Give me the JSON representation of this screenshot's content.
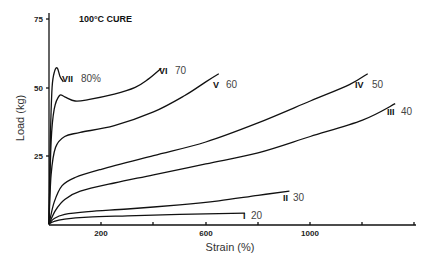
{
  "chart_data": {
    "type": "line",
    "title": "100°C CURE",
    "xlabel": "Strain (%)",
    "ylabel": "Load (kg)",
    "xlim": [
      0,
      1450
    ],
    "ylim": [
      0,
      75
    ],
    "x_ticks": [
      200,
      400,
      600,
      800,
      1000,
      1200,
      1400
    ],
    "x_tick_labels": [
      "200",
      "",
      "600",
      "",
      "1000",
      "",
      ""
    ],
    "y_ticks": [
      25,
      50,
      75
    ],
    "y_tick_labels": [
      "25",
      "50",
      "75"
    ],
    "grid": false,
    "legend": "inline labels at curve ends",
    "series": [
      {
        "name": "VII",
        "label_pct": "80%",
        "points": [
          [
            0,
            0
          ],
          [
            5,
            30
          ],
          [
            12,
            50
          ],
          [
            22,
            56
          ],
          [
            32,
            57
          ],
          [
            42,
            54
          ],
          [
            55,
            52
          ]
        ]
      },
      {
        "name": "VI",
        "label_pct": "70",
        "points": [
          [
            0,
            0
          ],
          [
            8,
            30
          ],
          [
            20,
            42
          ],
          [
            40,
            47
          ],
          [
            60,
            46.5
          ],
          [
            100,
            45
          ],
          [
            150,
            45.5
          ],
          [
            250,
            47.5
          ],
          [
            330,
            50
          ],
          [
            380,
            53
          ],
          [
            430,
            57
          ]
        ]
      },
      {
        "name": "V",
        "label_pct": "60",
        "points": [
          [
            0,
            0
          ],
          [
            8,
            18
          ],
          [
            25,
            28
          ],
          [
            60,
            32
          ],
          [
            120,
            33.5
          ],
          [
            250,
            36
          ],
          [
            400,
            41
          ],
          [
            520,
            47
          ],
          [
            600,
            52
          ],
          [
            650,
            55
          ]
        ]
      },
      {
        "name": "IV",
        "label_pct": "50",
        "points": [
          [
            0,
            0
          ],
          [
            20,
            8
          ],
          [
            50,
            14
          ],
          [
            100,
            17
          ],
          [
            200,
            20
          ],
          [
            400,
            25
          ],
          [
            600,
            30
          ],
          [
            800,
            37
          ],
          [
            1000,
            45
          ],
          [
            1150,
            51
          ],
          [
            1220,
            55
          ]
        ]
      },
      {
        "name": "III",
        "label_pct": "40",
        "points": [
          [
            0,
            0
          ],
          [
            25,
            5
          ],
          [
            60,
            9
          ],
          [
            120,
            12
          ],
          [
            250,
            15
          ],
          [
            400,
            18
          ],
          [
            600,
            22
          ],
          [
            800,
            26
          ],
          [
            1000,
            32
          ],
          [
            1200,
            38
          ],
          [
            1325,
            44
          ]
        ]
      },
      {
        "name": "II",
        "label_pct": "30",
        "points": [
          [
            0,
            0
          ],
          [
            20,
            2
          ],
          [
            60,
            3.5
          ],
          [
            150,
            4.5
          ],
          [
            300,
            5.5
          ],
          [
            500,
            7
          ],
          [
            650,
            8.5
          ],
          [
            800,
            10.5
          ],
          [
            920,
            12
          ]
        ]
      },
      {
        "name": "I",
        "label_pct": "20",
        "points": [
          [
            0,
            0
          ],
          [
            20,
            1
          ],
          [
            60,
            1.8
          ],
          [
            150,
            2.5
          ],
          [
            300,
            3
          ],
          [
            500,
            3.5
          ],
          [
            650,
            3.8
          ],
          [
            750,
            4
          ]
        ]
      }
    ]
  },
  "labels": {
    "title": "100°C CURE",
    "xlabel": "Strain (%)",
    "ylabel": "Load (kg)",
    "y75": "75",
    "y50": "50",
    "y25": "25",
    "x200": "200",
    "x600": "600",
    "x1000": "1000",
    "curves": [
      {
        "roman": "VII",
        "pct": "80%"
      },
      {
        "roman": "VI",
        "pct": "70"
      },
      {
        "roman": "V",
        "pct": "60"
      },
      {
        "roman": "IV",
        "pct": "50"
      },
      {
        "roman": "III",
        "pct": "40"
      },
      {
        "roman": "II",
        "pct": "30"
      },
      {
        "roman": "I",
        "pct": "20"
      }
    ]
  }
}
